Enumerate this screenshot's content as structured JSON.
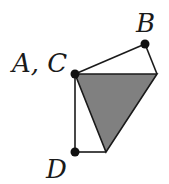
{
  "diagram": {
    "labels": {
      "ac": "A, C",
      "b": "B",
      "d": "D"
    },
    "points": {
      "AC": [
        75,
        74
      ],
      "B": [
        145,
        44
      ],
      "R": [
        157,
        74
      ],
      "D": [
        75,
        152
      ],
      "E": [
        106,
        152
      ]
    },
    "colors": {
      "stroke": "#1a1a1a",
      "fill": "#808080",
      "dot": "#111111"
    },
    "shaded_triangle": "AC-R-E",
    "edges": [
      "AC-B",
      "B-R",
      "AC-R",
      "AC-D",
      "D-E",
      "E-R",
      "AC-E"
    ]
  }
}
